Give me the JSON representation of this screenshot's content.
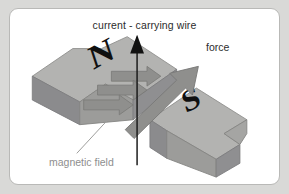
{
  "figure": {
    "kind": "physics-diagram",
    "panel": {
      "background_color": "#ffffff",
      "border_color": "#b9b9b7",
      "outer_background_color": "#d9d9d7"
    },
    "labels": {
      "wire": "current - carrying wire",
      "force": "force",
      "field": "magnetic field"
    },
    "magnets": [
      {
        "pole": "N",
        "name": "north-pole-magnet",
        "face_color": "#9a9a98",
        "top_color": "#b4b4b2",
        "side_color": "#86868a"
      },
      {
        "pole": "S",
        "name": "south-pole-magnet",
        "face_color": "#9a9a98",
        "top_color": "#b4b4b2",
        "side_color": "#86868a"
      }
    ],
    "colors": {
      "wire_line": "#1b1b1b",
      "force_arrow": "#8f8f8d",
      "field_arrow": "#8f8f8d",
      "leader_line": "#9d9d9b",
      "label_dark": "#2c2c2c",
      "label_gray": "#8e8e8e"
    },
    "arrows": {
      "wire_direction": "up",
      "force_direction": "up-right",
      "field_direction": "right-down",
      "field_arrow_count": 3
    }
  }
}
